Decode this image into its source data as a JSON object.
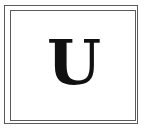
{
  "tile": {
    "letter": "U",
    "border_color": "#5a5a5a",
    "letter_color": "#111111"
  }
}
